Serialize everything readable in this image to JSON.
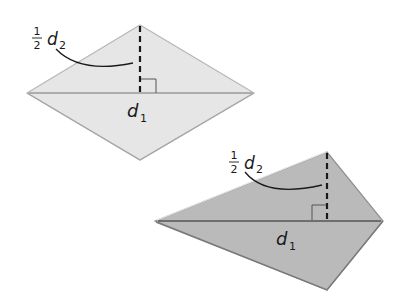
{
  "figures": [
    {
      "id": "rhombus",
      "shape": "rhombus",
      "fill": "#e6e6e6",
      "edge_color": "#b0b0b0",
      "diagonal_color": "#9a9a9a",
      "vertices": {
        "left": [
          27,
          93
        ],
        "top": [
          140,
          25
        ],
        "right": [
          254,
          93
        ],
        "bottom": [
          140,
          160
        ]
      },
      "labels": {
        "half_d2": {
          "fraction_num": "1",
          "fraction_den": "2",
          "var": "d",
          "sub": "2"
        },
        "d1": {
          "var": "d",
          "sub": "1"
        }
      }
    },
    {
      "id": "kite",
      "shape": "kite",
      "fill": "#bababa",
      "edge_color": "#8a8a8a",
      "diagonal_color": "#6e6e6e",
      "vertices": {
        "left": [
          155,
          221
        ],
        "top": [
          327,
          152
        ],
        "right": [
          383,
          221
        ],
        "bottom": [
          327,
          290
        ]
      },
      "labels": {
        "half_d2": {
          "fraction_num": "1",
          "fraction_den": "2",
          "var": "d",
          "sub": "2"
        },
        "d1": {
          "var": "d",
          "sub": "1"
        }
      }
    }
  ]
}
